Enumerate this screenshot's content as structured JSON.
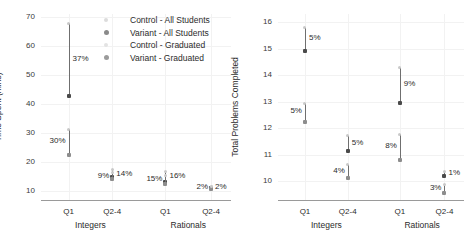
{
  "legend": {
    "items": [
      {
        "label": "Control - All Students",
        "marker": "control-all-dot",
        "color": "#dcdcdc"
      },
      {
        "label": "Variant - All Students",
        "marker": "variant-all-dot",
        "color": "#8a8a8a"
      },
      {
        "label": "Control - Graduated",
        "marker": "control-graduated-dot",
        "color": "#e3e3e3"
      },
      {
        "label": "Variant - Graduated",
        "marker": "variant-graduated-dot",
        "color": "#9b9b9b"
      }
    ]
  },
  "chart_data": [
    {
      "type": "scatter",
      "title": "",
      "xlabel": "",
      "ylabel": "Time Spent (mins)",
      "ylim": [
        7,
        71
      ],
      "yticks": [
        10,
        20,
        30,
        40,
        50,
        60,
        70
      ],
      "ytick_labels": [
        "10",
        "20",
        "30",
        "40",
        "50",
        "60",
        "70"
      ],
      "grid": true,
      "legend_position": "top-right",
      "categories": [
        "Q1",
        "Q2-4",
        "Q1",
        "Q2-4"
      ],
      "group_labels": [
        "Integers",
        "Rationals"
      ],
      "points": [
        {
          "group": "Integers",
          "quarter": "Q1",
          "series": "All Students",
          "value": 42.8,
          "err_low": 42.8,
          "err_high": 67.8,
          "pct": "37%",
          "pct_side": "right"
        },
        {
          "group": "Integers",
          "quarter": "Q1",
          "series": "Graduated",
          "value": 22.4,
          "err_low": 22.4,
          "err_high": 31.3,
          "pct": "30%",
          "pct_side": "left"
        },
        {
          "group": "Integers",
          "quarter": "Q2-4",
          "series": "All Students",
          "value": 15.0,
          "err_low": 13.9,
          "err_high": 17.4,
          "pct": "14%",
          "pct_side": "right"
        },
        {
          "group": "Integers",
          "quarter": "Q2-4",
          "series": "Graduated",
          "value": 14.2,
          "err_low": 13.4,
          "err_high": 16.6,
          "pct": "9%",
          "pct_side": "left"
        },
        {
          "group": "Rationals",
          "quarter": "Q1",
          "series": "All Students",
          "value": 13.3,
          "err_low": 12.6,
          "err_high": 16.9,
          "pct": "16%",
          "pct_side": "right"
        },
        {
          "group": "Rationals",
          "quarter": "Q1",
          "series": "Graduated",
          "value": 12.6,
          "err_low": 12.1,
          "err_high": 15.6,
          "pct": "15%",
          "pct_side": "left"
        },
        {
          "group": "Rationals",
          "quarter": "Q2-4",
          "series": "All Students",
          "value": 11.0,
          "err_low": 10.6,
          "err_high": 11.6,
          "pct": "2%",
          "pct_side": "right"
        },
        {
          "group": "Rationals",
          "quarter": "Q2-4",
          "series": "Graduated",
          "value": 10.9,
          "err_low": 10.5,
          "err_high": 11.5,
          "pct": "2%",
          "pct_side": "left"
        }
      ]
    },
    {
      "type": "scatter",
      "title": "",
      "xlabel": "",
      "ylabel": "Total Problems Completed",
      "ylim": [
        9.3,
        16.3
      ],
      "yticks": [
        10,
        11,
        12,
        13,
        14,
        15,
        16
      ],
      "ytick_labels": [
        "10",
        "11",
        "12",
        "13",
        "14",
        "15",
        "16"
      ],
      "grid": true,
      "legend_position": "none",
      "categories": [
        "Q1",
        "Q2-4",
        "Q1",
        "Q2-4"
      ],
      "group_labels": [
        "Integers",
        "Rationals"
      ],
      "points": [
        {
          "group": "Integers",
          "quarter": "Q1",
          "series": "All Students",
          "value": 14.92,
          "err_low": 14.92,
          "err_high": 15.78,
          "pct": "5%",
          "pct_side": "right"
        },
        {
          "group": "Integers",
          "quarter": "Q1",
          "series": "Graduated",
          "value": 12.25,
          "err_low": 12.25,
          "err_high": 12.95,
          "pct": "5%",
          "pct_side": "left"
        },
        {
          "group": "Integers",
          "quarter": "Q2-4",
          "series": "All Students",
          "value": 11.13,
          "err_low": 11.13,
          "err_high": 11.72,
          "pct": "5%",
          "pct_side": "right"
        },
        {
          "group": "Integers",
          "quarter": "Q2-4",
          "series": "Graduated",
          "value": 10.12,
          "err_low": 10.12,
          "err_high": 10.62,
          "pct": "4%",
          "pct_side": "left"
        },
        {
          "group": "Rationals",
          "quarter": "Q1",
          "series": "All Students",
          "value": 12.95,
          "err_low": 12.95,
          "err_high": 14.28,
          "pct": "9%",
          "pct_side": "right"
        },
        {
          "group": "Rationals",
          "quarter": "Q1",
          "series": "Graduated",
          "value": 10.8,
          "err_low": 10.8,
          "err_high": 11.78,
          "pct": "8%",
          "pct_side": "left"
        },
        {
          "group": "Rationals",
          "quarter": "Q2-4",
          "series": "All Students",
          "value": 10.2,
          "err_low": 10.2,
          "err_high": 10.38,
          "pct": "1%",
          "pct_side": "right"
        },
        {
          "group": "Rationals",
          "quarter": "Q2-4",
          "series": "Graduated",
          "value": 9.55,
          "err_low": 9.55,
          "err_high": 9.9,
          "pct": "3%",
          "pct_side": "left"
        }
      ]
    }
  ]
}
